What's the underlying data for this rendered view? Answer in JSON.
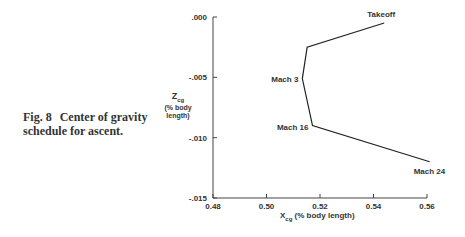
{
  "caption": {
    "number": "Fig. 8",
    "text": "Center of gravity schedule for ascent."
  },
  "chart_data": {
    "type": "line",
    "title": "Center of gravity schedule for ascent",
    "xlabel": "Xcg (% body length)",
    "ylabel": "Zcg (% body length)",
    "xlim": [
      0.48,
      0.56
    ],
    "ylim": [
      -0.015,
      0.0
    ],
    "xticks": [
      "0.48",
      "0.50",
      "0.52",
      "0.54",
      "0.56"
    ],
    "yticks": [
      ".000",
      "-.005",
      "-.010",
      "-.015"
    ],
    "grid": false,
    "series": [
      {
        "name": "CG schedule",
        "points": [
          {
            "x": 0.544,
            "y": -0.0005,
            "label": "Takeoff"
          },
          {
            "x": 0.5152,
            "y": -0.0025,
            "label": ""
          },
          {
            "x": 0.5134,
            "y": -0.0051,
            "label": "Mach 3"
          },
          {
            "x": 0.5172,
            "y": -0.009,
            "label": "Mach 16"
          },
          {
            "x": 0.561,
            "y": -0.012,
            "label": "Mach 24"
          }
        ]
      }
    ],
    "annotations": [
      "Takeoff",
      "Mach 3",
      "Mach 16",
      "Mach 24"
    ]
  },
  "labels": {
    "y_main": "Z",
    "y_sub": "cg",
    "y_unit": "(% body length)",
    "x_main": "X",
    "x_sub": "cg",
    "x_unit": " (% body length)"
  }
}
